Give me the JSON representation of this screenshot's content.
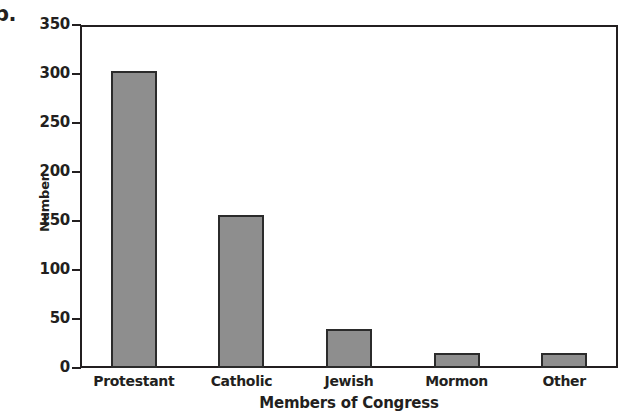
{
  "figure": {
    "panel_letter": "b.",
    "bar_fill_color": "#8e8e8e",
    "bar_edge_color": "#2b2b2b",
    "frame_color": "#231f20"
  },
  "chart_data": {
    "type": "bar",
    "title": "",
    "categories": [
      "Protestant",
      "Catholic",
      "Jewish",
      "Mormon",
      "Other"
    ],
    "values": [
      303,
      156,
      40,
      15,
      15
    ],
    "series": [
      {
        "name": "Number",
        "values": [
          303,
          156,
          40,
          15,
          15
        ]
      }
    ],
    "xlabel": "Members of Congress",
    "ylabel": "Number",
    "ylim": [
      0,
      350
    ],
    "yticks": [
      0,
      50,
      100,
      150,
      200,
      250,
      300,
      350
    ],
    "ytick_labels": [
      "0",
      "50",
      "100",
      "150",
      "200",
      "250",
      "300",
      "350"
    ],
    "grid": false,
    "legend": false
  }
}
